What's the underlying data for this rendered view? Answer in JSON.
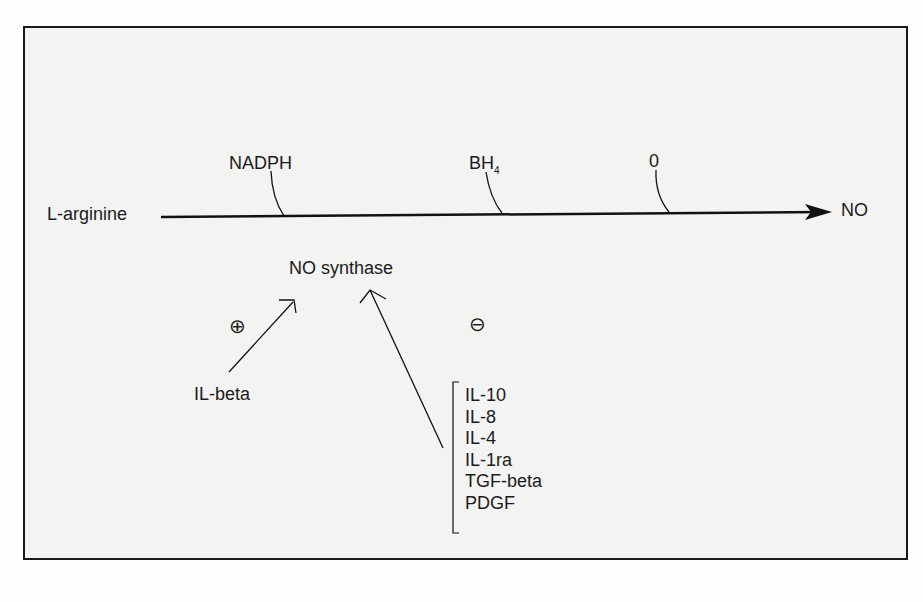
{
  "diagram": {
    "substrate": "L-arginine",
    "product": "NO",
    "cofactors": [
      {
        "label": "NADPH",
        "sub": ""
      },
      {
        "label": "BH",
        "sub": "4"
      },
      {
        "label": "0",
        "sub": ""
      }
    ],
    "enzyme": "NO synthase",
    "stimulatory": {
      "symbol": "⊕",
      "factors": [
        "IL-beta"
      ]
    },
    "inhibitory": {
      "symbol": "⊖",
      "factors": [
        "IL-10",
        "IL-8",
        "IL-4",
        "IL-1ra",
        "TGF-beta",
        "PDGF"
      ]
    }
  }
}
